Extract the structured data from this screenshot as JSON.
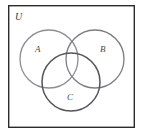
{
  "figure": {
    "kind": "venn-diagram",
    "background_color": "#ffffff",
    "width": 143,
    "height": 134
  },
  "universe": {
    "label": "U",
    "border_color": "#2b2b2b",
    "border_width": 1.4,
    "fill": "#ffffff",
    "rect": {
      "x": 8,
      "y": 5,
      "width": 127,
      "height": 123
    }
  },
  "sets": [
    {
      "id": "A",
      "label": "A",
      "stroke": "#8d8d93",
      "stroke_width": 1.3,
      "cx": 49,
      "cy": 59,
      "r": 29,
      "label_x": 38,
      "label_y": 50
    },
    {
      "id": "B",
      "label": "B",
      "stroke": "#7c7c82",
      "stroke_width": 1.3,
      "cx": 95,
      "cy": 59,
      "r": 29,
      "label_x": 103,
      "label_y": 50
    },
    {
      "id": "C",
      "label": "C",
      "stroke": "#55555a",
      "stroke_width": 1.5,
      "cx": 71,
      "cy": 82,
      "r": 29,
      "label_x": 70,
      "label_y": 98
    }
  ]
}
